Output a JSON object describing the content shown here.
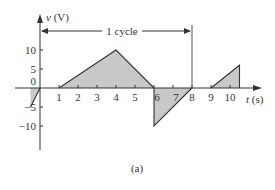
{
  "chart_data": {
    "type": "area",
    "title": "",
    "caption": "(a)",
    "xlabel": "t (s)",
    "ylabel": "v (V)",
    "x_ticks": [
      1,
      2,
      3,
      4,
      5,
      6,
      7,
      8,
      9,
      10
    ],
    "y_ticks": [
      10,
      5,
      0,
      -5,
      -10
    ],
    "xlim": [
      -0.5,
      11.5
    ],
    "ylim": [
      -12,
      16
    ],
    "annotation": {
      "text": "1 cycle",
      "from_t": 0,
      "to_t": 8
    },
    "series": [
      {
        "name": "v(t)",
        "segments": [
          {
            "points": [
              [
                -0.5,
                -5
              ],
              [
                0,
                0
              ]
            ]
          },
          {
            "points": [
              [
                1,
                0
              ],
              [
                4,
                10
              ],
              [
                6,
                0
              ]
            ]
          },
          {
            "points": [
              [
                6,
                0
              ],
              [
                6,
                -10
              ],
              [
                8,
                0
              ]
            ]
          },
          {
            "points": [
              [
                9,
                0
              ],
              [
                10.5,
                6
              ],
              [
                10.5,
                0
              ]
            ]
          }
        ]
      }
    ],
    "fill_color": "#c8c8c8",
    "line_color": "#333333",
    "grid": false,
    "legend": null
  }
}
